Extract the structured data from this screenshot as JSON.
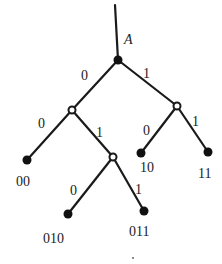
{
  "diagram": {
    "type": "binary-code-tree",
    "root_label": "A",
    "colors": {
      "line": "#1a1a1a",
      "node_fill": "#111111",
      "background": "#ffffff"
    },
    "nodes": [
      {
        "id": "root",
        "label": "A",
        "kind": "filled",
        "x": 118,
        "y": 60
      },
      {
        "id": "n0",
        "label": "",
        "kind": "hollow",
        "x": 72,
        "y": 110
      },
      {
        "id": "n1",
        "label": "",
        "kind": "hollow",
        "x": 177,
        "y": 106
      },
      {
        "id": "n01",
        "label": "",
        "kind": "hollow",
        "x": 113,
        "y": 157
      },
      {
        "id": "leaf00",
        "label": "00",
        "kind": "filled",
        "x": 27,
        "y": 160
      },
      {
        "id": "leaf10",
        "label": "10",
        "kind": "filled",
        "x": 141,
        "y": 153
      },
      {
        "id": "leaf11",
        "label": "11",
        "kind": "filled",
        "x": 208,
        "y": 152
      },
      {
        "id": "leaf010",
        "label": "010",
        "kind": "filled",
        "x": 68,
        "y": 214
      },
      {
        "id": "leaf011",
        "label": "011",
        "kind": "filled",
        "x": 144,
        "y": 211
      }
    ],
    "edges": [
      {
        "from": "top",
        "to": "root",
        "label": ""
      },
      {
        "from": "root",
        "to": "n0",
        "label": "0"
      },
      {
        "from": "root",
        "to": "n1",
        "label": "1"
      },
      {
        "from": "n0",
        "to": "leaf00",
        "label": "0"
      },
      {
        "from": "n0",
        "to": "n01",
        "label": "1"
      },
      {
        "from": "n1",
        "to": "leaf10",
        "label": "0"
      },
      {
        "from": "n1",
        "to": "leaf11",
        "label": "1"
      },
      {
        "from": "n01",
        "to": "leaf010",
        "label": "0"
      },
      {
        "from": "n01",
        "to": "leaf011",
        "label": "1"
      }
    ],
    "labels": {
      "root": "A",
      "edge_root_left": "0",
      "edge_root_right": "1",
      "edge_n0_left": "0",
      "edge_n0_right": "1",
      "edge_n1_left": "0",
      "edge_n1_right": "1",
      "edge_n01_left": "0",
      "edge_n01_right": "1",
      "leaf_00": "00",
      "leaf_10": "10",
      "leaf_11": "11",
      "leaf_010": "010",
      "leaf_011": "011"
    }
  }
}
